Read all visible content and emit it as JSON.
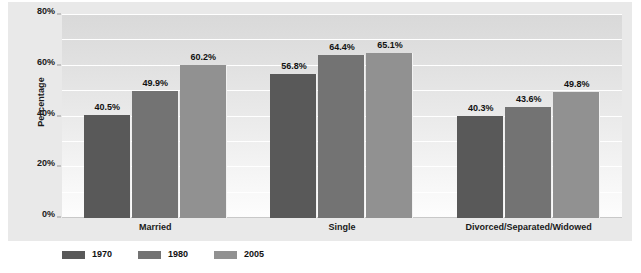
{
  "chart_data": {
    "type": "bar",
    "title": "",
    "subtitle": "",
    "xlabel": "",
    "ylabel": "Percentage",
    "ylim": [
      0,
      80
    ],
    "yticks": [
      "0%",
      "20%",
      "40%",
      "60%",
      "80%"
    ],
    "ytick_values": [
      0,
      20,
      40,
      60,
      80
    ],
    "ytick_suffix": "%",
    "grid": true,
    "gridline_interval": 10,
    "legend_position": "bottom",
    "orientation": "vertical",
    "grouping": "grouped",
    "categories": [
      "Married",
      "Single",
      "Divorced/Separated/Widowed"
    ],
    "series": [
      {
        "name": "1970",
        "color": "#595959",
        "values": [
          40.5,
          56.8,
          40.3
        ],
        "labels": [
          "40.5%",
          "56.8%",
          "40.3%"
        ]
      },
      {
        "name": "1980",
        "color": "#737373",
        "values": [
          49.9,
          64.4,
          43.6
        ],
        "labels": [
          "49.9%",
          "64.4%",
          "43.6%"
        ]
      },
      {
        "name": "2005",
        "color": "#919191",
        "values": [
          60.2,
          65.1,
          49.8
        ],
        "labels": [
          "60.2%",
          "65.1%",
          "49.8%"
        ]
      }
    ],
    "colors": {
      "plot_background_top": "#d9d9d9",
      "plot_background_bottom": "#fdfdfd",
      "frame_background": "#e9e9e9",
      "gridline": "#ffffff",
      "text": "#111111"
    }
  },
  "legend": {
    "items": [
      {
        "label": "1970",
        "color": "#595959"
      },
      {
        "label": "1980",
        "color": "#737373"
      },
      {
        "label": "2005",
        "color": "#919191"
      }
    ]
  }
}
